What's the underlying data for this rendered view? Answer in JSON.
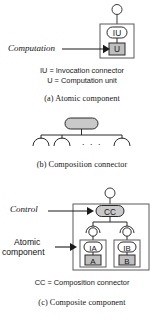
{
  "figure": {
    "title_semantic": "component-model-diagram",
    "colors": {
      "stroke": "#2b2b2b",
      "fill_unit": "#bfbfbf",
      "fill_connector": "#c9c9c9",
      "background": "#ffffff",
      "text": "#161616"
    }
  },
  "panel_a": {
    "caption": "(a)  Atomic component",
    "annotation_computation": "Computation",
    "legend_line1": "IU = Invocation connector",
    "legend_line2": "U = Computation unit",
    "node_iu": "IU",
    "node_u": "U"
  },
  "panel_b": {
    "caption": "(b)  Composition connector",
    "ellipsis": ". . .",
    "arc_count": 3
  },
  "panel_c": {
    "caption": "(c)  Composite component",
    "annotation_control": "Control",
    "annotation_atomic_line1": "Atomic",
    "annotation_atomic_line2": "component",
    "legend_line1": "CC = Composition connector",
    "node_cc": "CC",
    "node_ia": "IA",
    "node_a": "A",
    "node_ib": "IB",
    "node_b": "B"
  }
}
